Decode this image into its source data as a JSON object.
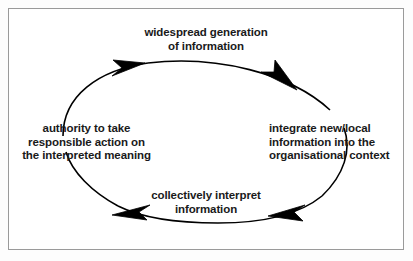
{
  "diagram": {
    "shape": "ellipse",
    "direction": "clockwise",
    "frame_color": "#9a9a9a",
    "line_color": "#000000",
    "text_color": "#1a1a1a",
    "background": "#ffffff",
    "stages": [
      {
        "id": "widespread-generation",
        "position": "top",
        "lines": [
          "widespread generation",
          "of information"
        ]
      },
      {
        "id": "integrate-new-local",
        "position": "right",
        "lines": [
          "integrate new/local",
          "information into the",
          "organisational context"
        ]
      },
      {
        "id": "collectively-interpret",
        "position": "bottom",
        "lines": [
          "collectively interpret",
          "information"
        ]
      },
      {
        "id": "authority-to-take-action",
        "position": "left",
        "lines": [
          "authority to take",
          "responsible action on",
          "the interpreted meaning"
        ]
      }
    ],
    "arrows": [
      {
        "id": "arrow-top-left",
        "points": "right"
      },
      {
        "id": "arrow-top-right",
        "points": "down-right"
      },
      {
        "id": "arrow-bottom-right",
        "points": "left"
      },
      {
        "id": "arrow-bottom-left",
        "points": "left"
      }
    ]
  }
}
